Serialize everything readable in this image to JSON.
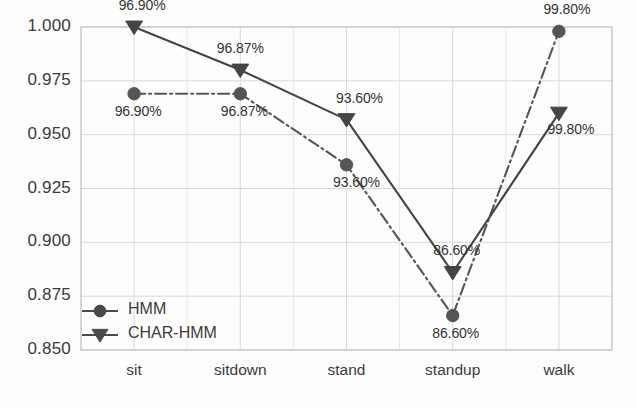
{
  "chart_data": {
    "type": "line",
    "title": "",
    "xlabel": "",
    "ylabel": "",
    "categories": [
      "sit",
      "sitdown",
      "stand",
      "standup",
      "walk"
    ],
    "ylim": [
      0.85,
      1.0
    ],
    "yticks": [
      "0.850",
      "0.875",
      "0.900",
      "0.925",
      "0.950",
      "0.975",
      "1.000"
    ],
    "ytick_values": [
      0.85,
      0.875,
      0.9,
      0.925,
      0.95,
      0.975,
      1.0
    ],
    "grid": true,
    "legend_position": "lower-left-inside",
    "series": [
      {
        "name": "HMM",
        "marker": "circle",
        "linestyle": "dashdot",
        "color": "#555555",
        "values": [
          0.969,
          0.969,
          0.936,
          0.866,
          0.998
        ],
        "labels": [
          "96.90%",
          "96.87%",
          "93.60%",
          "86.60%",
          "99.80%"
        ],
        "label_position": "below"
      },
      {
        "name": "CHAR-HMM",
        "marker": "triangle-down",
        "linestyle": "solid",
        "color": "#444444",
        "values": [
          1.0,
          0.98,
          0.957,
          0.886,
          0.96
        ],
        "labels": [
          "96.90%",
          "96.87%",
          "93.60%",
          "86.60%",
          "99.80%"
        ],
        "label_position": "above"
      }
    ]
  },
  "legend": {
    "items": [
      {
        "label": "HMM",
        "marker": "circle"
      },
      {
        "label": "CHAR-HMM",
        "marker": "triangle-down"
      }
    ]
  },
  "style": {
    "grid_color": "#d8d8d8",
    "axis_color": "#bbbbbb",
    "series_color": "#4a4a4a",
    "text_color": "#3b3b3b",
    "background": "#fdfdfd"
  }
}
